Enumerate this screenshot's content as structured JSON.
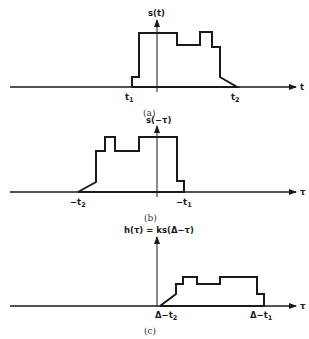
{
  "panels": [
    {
      "id": "a",
      "caption": "(a)",
      "y_label": "s(t)",
      "x_label": "t",
      "ticks": [
        {
          "main": "t",
          "sub": "1"
        },
        {
          "main": "t",
          "sub": "2"
        }
      ]
    },
    {
      "id": "b",
      "caption": "(b)",
      "y_label": "s(−τ)",
      "x_label": "τ",
      "ticks": [
        {
          "main": "−t",
          "sub": "2"
        },
        {
          "main": "−t",
          "sub": "1"
        }
      ]
    },
    {
      "id": "c",
      "caption": "(c)",
      "y_label": "h(τ) = ks(Δ−τ)",
      "x_label": "τ",
      "ticks": [
        {
          "main": "Δ−t",
          "sub": "2"
        },
        {
          "main": "Δ−t",
          "sub": "1"
        }
      ]
    }
  ],
  "colors": {
    "ink": "#1a1a1a",
    "background": "#ffffff"
  }
}
